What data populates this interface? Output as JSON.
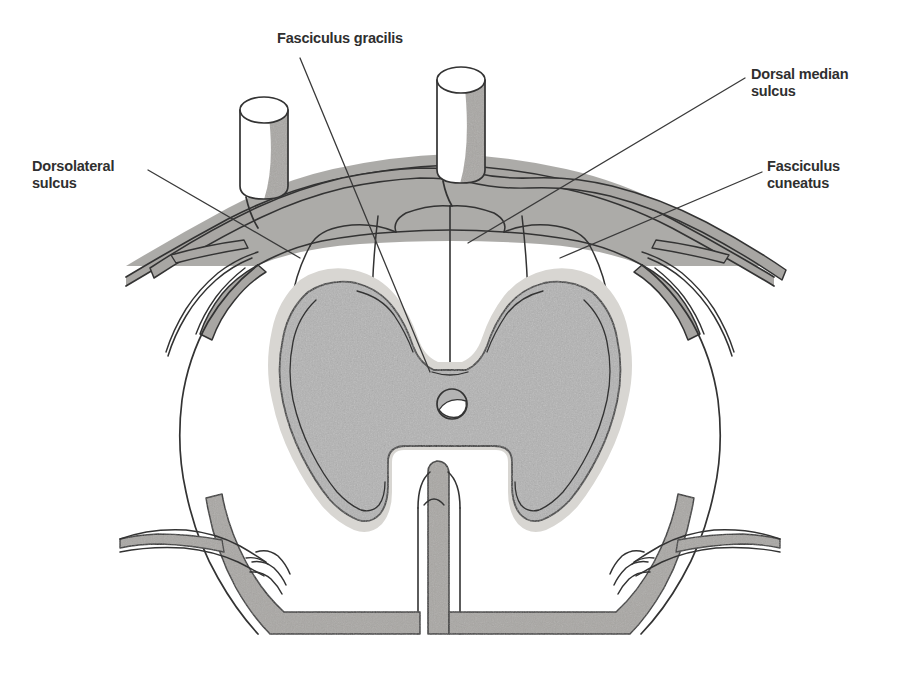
{
  "figure": {
    "background_color": "#ffffff"
  },
  "labels": {
    "fasciculus_gracilis": "Fasciculus gracilis",
    "dorsal_median_sulcus": "Dorsal median\nsulcus",
    "dorsolateral_sulcus": "Dorsolateral\nsulcus",
    "fasciculus_cuneatus": "Fasciculus\ncuneatus"
  },
  "colors": {
    "label_text": "#2f2f2f",
    "ink": "#333333",
    "gray_matter": "#b3b3b3",
    "gray_matter_halo": "#d8d6d2",
    "pia_band": "#a8a6a3",
    "root_shade": "#a9a7a4",
    "white_matter": "#ffffff",
    "background": "#ffffff"
  },
  "structures": [
    {
      "name": "dorsal-root-cylinder-left",
      "kind": "cut-nerve-root"
    },
    {
      "name": "dorsal-root-cylinder-right",
      "kind": "cut-nerve-root"
    },
    {
      "name": "fasciculus-gracilis-left",
      "kind": "white-matter-column"
    },
    {
      "name": "fasciculus-gracilis-right",
      "kind": "white-matter-column"
    },
    {
      "name": "fasciculus-cuneatus-left",
      "kind": "white-matter-column"
    },
    {
      "name": "fasciculus-cuneatus-right",
      "kind": "white-matter-column"
    },
    {
      "name": "dorsal-median-septum",
      "kind": "sulcus"
    },
    {
      "name": "dorsal-intermediate-sulcus-left",
      "kind": "sulcus"
    },
    {
      "name": "dorsal-intermediate-sulcus-right",
      "kind": "sulcus"
    },
    {
      "name": "dorsolateral-sulcus-left",
      "kind": "sulcus"
    },
    {
      "name": "dorsolateral-sulcus-right",
      "kind": "sulcus"
    },
    {
      "name": "gray-matter-butterfly",
      "kind": "gray-matter"
    },
    {
      "name": "central-canal",
      "kind": "canal"
    },
    {
      "name": "ventral-median-fissure",
      "kind": "fissure"
    },
    {
      "name": "ventral-rootlets-left",
      "kind": "nerve-rootlets"
    },
    {
      "name": "ventral-rootlets-right",
      "kind": "nerve-rootlets"
    },
    {
      "name": "pia-mater-margin",
      "kind": "meninges"
    }
  ]
}
